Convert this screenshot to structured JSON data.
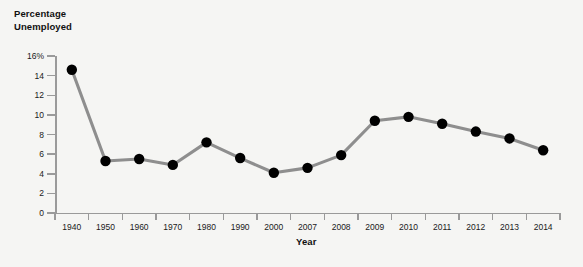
{
  "chart_data": {
    "type": "line",
    "title": "",
    "ylabel": "Percentage\nUnemployed",
    "xlabel": "Year",
    "categories": [
      "1940",
      "1950",
      "1960",
      "1970",
      "1980",
      "1990",
      "2000",
      "2007",
      "2008",
      "2009",
      "2010",
      "2011",
      "2012",
      "2013",
      "2014"
    ],
    "values": [
      14.6,
      5.3,
      5.5,
      4.9,
      7.2,
      5.6,
      4.1,
      4.6,
      5.9,
      9.4,
      9.8,
      9.1,
      8.3,
      7.6,
      6.4
    ],
    "ylim": [
      0,
      16
    ],
    "y_ticks": [
      0,
      2,
      4,
      6,
      8,
      10,
      12,
      14,
      16
    ],
    "y_tick_labels": [
      "0",
      "2",
      "4",
      "6",
      "8",
      "10",
      "12",
      "14",
      "16%"
    ],
    "grid": false,
    "legend": "none",
    "series_color": "#8e8e8e",
    "marker_color": "#000000",
    "axis_color": "#9a9a9a",
    "background_color": "#f5f5f3"
  }
}
